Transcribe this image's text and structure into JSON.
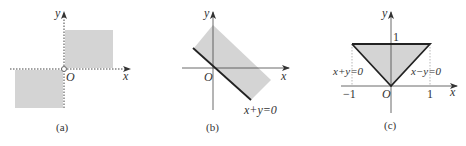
{
  "colors": {
    "axis": "#333333",
    "shade": "#d4d4d4",
    "line": "#222222",
    "dotted": "#999999"
  },
  "diagrams": [
    {
      "id": "a",
      "caption": "(a)",
      "x_label": "x",
      "y_label": "y",
      "origin_label": "O",
      "description": "Shaded first and third quadrant regions, dotted axes, open circle at origin"
    },
    {
      "id": "b",
      "caption": "(b)",
      "x_label": "x",
      "y_label": "y",
      "origin_label": "O",
      "line_label": "x+y=0",
      "description": "Shaded strip above line x+y=0"
    },
    {
      "id": "c",
      "caption": "(c)",
      "x_label": "x",
      "y_label": "y",
      "origin_label": "O",
      "y_tick": "1",
      "x_ticks": [
        "−1",
        "1"
      ],
      "left_line_label": "x+y=0",
      "right_line_label": "x−y=0",
      "description": "Shaded triangle bounded by x+y=0, x−y=0 and y=1"
    }
  ]
}
